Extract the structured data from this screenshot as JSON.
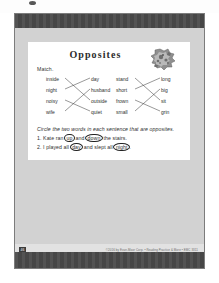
{
  "document": {
    "title": "Opposites",
    "match_label": "Match.",
    "clipart_name": "sun-and-moon-clipart",
    "match_groups": [
      {
        "id": "left",
        "left_words": [
          "inside",
          "night",
          "noisy",
          "wife"
        ],
        "right_words": [
          "day",
          "husband",
          "outside",
          "quiet"
        ],
        "connections": [
          [
            0,
            2
          ],
          [
            1,
            0
          ],
          [
            2,
            3
          ],
          [
            3,
            1
          ]
        ]
      },
      {
        "id": "right",
        "left_words": [
          "stand",
          "short",
          "frown",
          "small"
        ],
        "right_words": [
          "long",
          "big",
          "sit",
          "grin"
        ],
        "connections": [
          [
            0,
            2
          ],
          [
            1,
            0
          ],
          [
            2,
            3
          ],
          [
            3,
            1
          ]
        ]
      }
    ],
    "circle_instruction": "Circle the two words in each sentence that are opposites.",
    "sentences": [
      {
        "number": "1.",
        "parts": [
          {
            "text": "Kate ran ",
            "circled": false
          },
          {
            "text": "up",
            "circled": true
          },
          {
            "text": " and ",
            "circled": false
          },
          {
            "text": "down",
            "circled": true
          },
          {
            "text": " the stairs.",
            "circled": false
          }
        ]
      },
      {
        "number": "2.",
        "parts": [
          {
            "text": "I played all ",
            "circled": false
          },
          {
            "text": "day",
            "circled": true
          },
          {
            "text": " and slept all ",
            "circled": false
          },
          {
            "text": "night",
            "circled": true
          },
          {
            "text": ".",
            "circled": false
          }
        ]
      }
    ],
    "copyright": "©2016 by Evan-Moor Corp. • Reading Practice & More • EMC 3311",
    "page_number": "46"
  }
}
